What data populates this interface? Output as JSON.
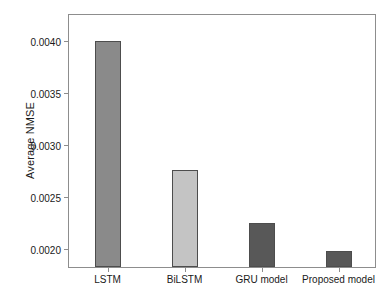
{
  "chart_data": {
    "type": "bar",
    "title": "",
    "xlabel": "",
    "ylabel": "Average NMSE",
    "categories": [
      "LSTM",
      "BiLSTM",
      "GRU model",
      "Proposed model"
    ],
    "values": [
      0.00398,
      0.00274,
      0.00223,
      0.00196
    ],
    "bar_colors": [
      "#8a8a8a",
      "#c4c4c4",
      "#585858",
      "#585858"
    ],
    "bar_edge_color": "#4d4d4d",
    "ytick_labels": [
      "0.0020",
      "0.0025",
      "0.0030",
      "0.0035",
      "0.0040"
    ],
    "ytick_values": [
      0.002,
      0.0025,
      0.003,
      0.0035,
      0.004
    ],
    "ylim": [
      0.00181,
      0.00425
    ],
    "xlim": [
      0,
      4
    ],
    "grid": false,
    "legend": "none",
    "frame_color": "#8d8d8d",
    "background": "#ffffff"
  }
}
